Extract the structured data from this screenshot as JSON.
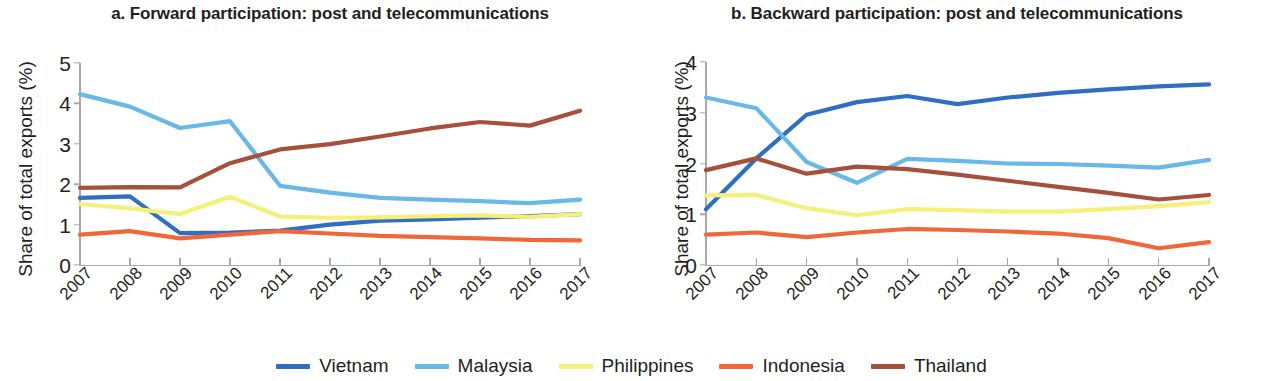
{
  "figure": {
    "y_axis_label": "Share of total exports (%)"
  },
  "legend": {
    "items": [
      {
        "label": "Vietnam",
        "color": "#2e6fc4"
      },
      {
        "label": "Malaysia",
        "color": "#69b8e8"
      },
      {
        "label": "Philippines",
        "color": "#f4f07a"
      },
      {
        "label": "Indonesia",
        "color": "#f0683a"
      },
      {
        "label": "Thailand",
        "color": "#a6503c"
      }
    ]
  },
  "chart_data": [
    {
      "type": "line",
      "panel": "a",
      "title": "a. Forward participation: post and telecommunications",
      "xlabel": "",
      "ylabel": "Share of total exports (%)",
      "categories": [
        "2007",
        "2008",
        "2009",
        "2010",
        "2011",
        "2012",
        "2013",
        "2014",
        "2015",
        "2016",
        "2017"
      ],
      "x": [
        2007,
        2008,
        2009,
        2010,
        2011,
        2012,
        2013,
        2014,
        2015,
        2016,
        2017
      ],
      "ylim": [
        0,
        5
      ],
      "yticks": [
        0,
        1,
        2,
        3,
        4,
        5
      ],
      "grid": false,
      "legend_position": "bottom",
      "series": [
        {
          "name": "Vietnam",
          "color": "#2e6fc4",
          "values": [
            1.66,
            1.7,
            0.79,
            0.8,
            0.85,
            1.0,
            1.1,
            1.13,
            1.17,
            1.21,
            1.26
          ]
        },
        {
          "name": "Malaysia",
          "color": "#69b8e8",
          "values": [
            4.23,
            3.92,
            3.39,
            3.56,
            1.96,
            1.79,
            1.66,
            1.62,
            1.58,
            1.53,
            1.62
          ]
        },
        {
          "name": "Philippines",
          "color": "#f4f07a",
          "values": [
            1.51,
            1.4,
            1.26,
            1.69,
            1.2,
            1.17,
            1.18,
            1.21,
            1.23,
            1.19,
            1.26
          ]
        },
        {
          "name": "Indonesia",
          "color": "#f0683a",
          "values": [
            0.75,
            0.84,
            0.66,
            0.75,
            0.84,
            0.78,
            0.72,
            0.69,
            0.66,
            0.62,
            0.61
          ]
        },
        {
          "name": "Thailand",
          "color": "#a6503c",
          "values": [
            1.91,
            1.93,
            1.92,
            2.52,
            2.86,
            2.99,
            3.18,
            3.38,
            3.54,
            3.45,
            3.82
          ]
        }
      ]
    },
    {
      "type": "line",
      "panel": "b",
      "title": "b. Backward participation: post and telecommunications",
      "xlabel": "",
      "ylabel": "Share of total exports (%)",
      "categories": [
        "2007",
        "2008",
        "2009",
        "2010",
        "2011",
        "2012",
        "2013",
        "2014",
        "2015",
        "2016",
        "2017"
      ],
      "x": [
        2007,
        2008,
        2009,
        2010,
        2011,
        2012,
        2013,
        2014,
        2015,
        2016,
        2017
      ],
      "ylim": [
        0,
        4
      ],
      "yticks": [
        0,
        1,
        2,
        3,
        4
      ],
      "grid": false,
      "legend_position": "bottom",
      "series": [
        {
          "name": "Vietnam",
          "color": "#2e6fc4",
          "values": [
            1.1,
            2.1,
            2.96,
            3.21,
            3.33,
            3.17,
            3.3,
            3.39,
            3.46,
            3.52,
            3.56
          ]
        },
        {
          "name": "Malaysia",
          "color": "#69b8e8",
          "values": [
            3.3,
            3.09,
            2.03,
            1.62,
            2.09,
            2.05,
            2.0,
            1.99,
            1.96,
            1.92,
            2.07
          ]
        },
        {
          "name": "Philippines",
          "color": "#f4f07a",
          "values": [
            1.37,
            1.38,
            1.12,
            0.98,
            1.1,
            1.08,
            1.05,
            1.05,
            1.1,
            1.16,
            1.24
          ]
        },
        {
          "name": "Indonesia",
          "color": "#f0683a",
          "values": [
            0.6,
            0.64,
            0.55,
            0.64,
            0.71,
            0.69,
            0.66,
            0.62,
            0.53,
            0.33,
            0.45
          ]
        },
        {
          "name": "Thailand",
          "color": "#a6503c",
          "values": [
            1.87,
            2.1,
            1.8,
            1.94,
            1.89,
            1.78,
            1.66,
            1.54,
            1.42,
            1.29,
            1.38
          ]
        }
      ]
    }
  ]
}
